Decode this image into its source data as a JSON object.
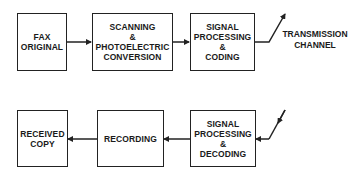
{
  "diagram": {
    "title": "",
    "transmit_chain": [
      {
        "id": "fax-original",
        "lines": [
          "FAX",
          "ORIGINAL"
        ]
      },
      {
        "id": "scanning",
        "lines": [
          "SCANNING",
          "&",
          "PHOTOELECTRIC",
          "CONVERSION"
        ]
      },
      {
        "id": "signal-coding",
        "lines": [
          "SIGNAL",
          "PROCESSING",
          "&",
          "CODING"
        ]
      }
    ],
    "channel_label": [
      "TRANSMISSION",
      "CHANNEL"
    ],
    "receive_chain": [
      {
        "id": "signal-decoding",
        "lines": [
          "SIGNAL",
          "PROCESSING",
          "&",
          "DECODING"
        ]
      },
      {
        "id": "recording",
        "lines": [
          "RECORDING"
        ]
      },
      {
        "id": "received-copy",
        "lines": [
          "RECEIVED",
          "COPY"
        ]
      }
    ],
    "colors": {
      "line": "#222222",
      "background": "#ffffff"
    }
  }
}
